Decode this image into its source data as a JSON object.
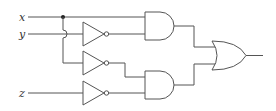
{
  "diagram": {
    "type": "logic-circuit",
    "inputs": [
      {
        "label": "x"
      },
      {
        "label": "y"
      },
      {
        "label": "z"
      }
    ],
    "gates": [
      {
        "id": "not1",
        "type": "NOT",
        "input": "y"
      },
      {
        "id": "not2",
        "type": "NOT",
        "input": "x"
      },
      {
        "id": "not3",
        "type": "NOT",
        "input": "z"
      },
      {
        "id": "and1",
        "type": "AND",
        "inputs": [
          "x",
          "not1"
        ]
      },
      {
        "id": "and2",
        "type": "AND",
        "inputs": [
          "not2",
          "not3"
        ]
      },
      {
        "id": "or1",
        "type": "OR",
        "inputs": [
          "and1",
          "and2"
        ]
      }
    ],
    "colors": {
      "wire": "#555555",
      "background": "#ffffff"
    }
  }
}
